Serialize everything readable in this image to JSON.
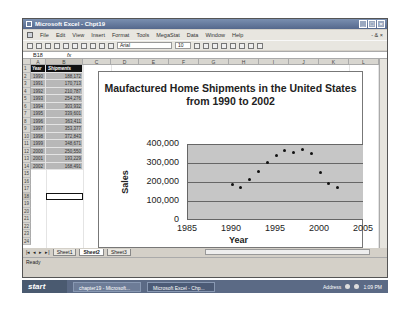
{
  "window": {
    "title": "Microsoft Excel - Chpt19",
    "controls": [
      "minimize",
      "maximize",
      "close"
    ]
  },
  "menu": {
    "items": [
      "File",
      "Edit",
      "View",
      "Insert",
      "Format",
      "Tools",
      "MegaStat",
      "Data",
      "Window",
      "Help"
    ],
    "right": "- & ×"
  },
  "toolbar": {
    "font": "Arial",
    "size": "10"
  },
  "formula_bar": {
    "name_box": "B18",
    "fx": "fx",
    "value": ""
  },
  "columns": [
    "A",
    "B",
    "C",
    "D",
    "E",
    "F",
    "G",
    "H",
    "I",
    "J",
    "K",
    "L"
  ],
  "rows": [
    "1",
    "2",
    "3",
    "4",
    "5",
    "6",
    "7",
    "8",
    "9",
    "10",
    "11",
    "12",
    "13",
    "14",
    "15",
    "16",
    "17",
    "18",
    "19",
    "20",
    "21",
    "22",
    "23",
    "24"
  ],
  "table": {
    "headers": [
      "Year",
      "Shipments"
    ],
    "rows": [
      [
        "1990",
        "188,172"
      ],
      [
        "1991",
        "170,713"
      ],
      [
        "1992",
        "210,787"
      ],
      [
        "1993",
        "254,276"
      ],
      [
        "1994",
        "303,932"
      ],
      [
        "1995",
        "339,601"
      ],
      [
        "1996",
        "363,411"
      ],
      [
        "1997",
        "353,377"
      ],
      [
        "1998",
        "372,843"
      ],
      [
        "1999",
        "348,671"
      ],
      [
        "2000",
        "250,550"
      ],
      [
        "2001",
        "193,229"
      ],
      [
        "2002",
        "168,491"
      ]
    ]
  },
  "selected_cell": "B18",
  "chart_data": {
    "type": "scatter",
    "title": "Maufactured Home Shipments in the United States from 1990 to 2002",
    "xlabel": "Year",
    "ylabel": "Sales",
    "x": [
      1990,
      1991,
      1992,
      1993,
      1994,
      1995,
      1996,
      1997,
      1998,
      1999,
      2000,
      2001,
      2002
    ],
    "y": [
      188172,
      170713,
      210787,
      254276,
      303932,
      339601,
      363411,
      353377,
      372843,
      348671,
      250550,
      193229,
      168491
    ],
    "xlim": [
      1985,
      2005
    ],
    "ylim": [
      0,
      400000
    ],
    "xticks": [
      "1985",
      "1990",
      "1995",
      "2000",
      "2005"
    ],
    "yticks": [
      "0",
      "100,000",
      "200,000",
      "300,000",
      "400,000"
    ],
    "grid": true,
    "legend": false,
    "plot_background": "#c6c6c6"
  },
  "sheet_tabs": {
    "items": [
      "Sheet1",
      "Sheet2",
      "Sheet3"
    ],
    "active": "Sheet2"
  },
  "status": {
    "text": "Ready"
  },
  "taskbar": {
    "start": "start",
    "tasks": [
      "chapter19 - Microsoft...",
      "Microsoft Excel - Chp..."
    ],
    "tray_label": "Address",
    "time": "1:09 PM"
  }
}
